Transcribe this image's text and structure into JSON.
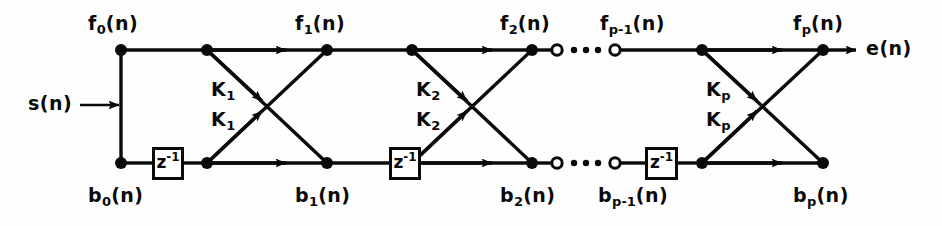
{
  "figure": {
    "line_color": "#0a0a0a",
    "background_color": "#ffffff"
  },
  "input": {
    "label": "s(n)",
    "name": "input-signal"
  },
  "output": {
    "label": "e(n)",
    "name": "output-error-signal"
  },
  "delay_blocks": [
    {
      "base": "z",
      "exponent": "-1"
    },
    {
      "base": "z",
      "exponent": "-1"
    },
    {
      "base": "z",
      "exponent": "-1"
    }
  ],
  "forward_labels": [
    {
      "base": "f",
      "sub": "0",
      "arg": "(n)"
    },
    {
      "base": "f",
      "sub": "1",
      "arg": "(n)"
    },
    {
      "base": "f",
      "sub": "2",
      "arg": "(n)"
    },
    {
      "base": "f",
      "sub": "p-1",
      "arg": "(n)"
    },
    {
      "base": "f",
      "sub": "p",
      "arg": "(n)"
    }
  ],
  "backward_labels": [
    {
      "base": "b",
      "sub": "0",
      "arg": "(n)"
    },
    {
      "base": "b",
      "sub": "1",
      "arg": "(n)"
    },
    {
      "base": "b",
      "sub": "2",
      "arg": "(n)"
    },
    {
      "base": "b",
      "sub": "p-1",
      "arg": "(n)"
    },
    {
      "base": "b",
      "sub": "p",
      "arg": "(n)"
    }
  ],
  "reflection_coefficients": [
    {
      "base": "K",
      "sub": "1",
      "position": "upper"
    },
    {
      "base": "K",
      "sub": "1",
      "position": "lower"
    },
    {
      "base": "K",
      "sub": "2",
      "position": "upper"
    },
    {
      "base": "K",
      "sub": "2",
      "position": "lower"
    },
    {
      "base": "K",
      "sub": "p",
      "position": "upper"
    },
    {
      "base": "K",
      "sub": "p",
      "position": "lower"
    }
  ],
  "ellipsis": {
    "glyph": "•",
    "count": 3,
    "meaning": "stages 3 through p-1 omitted"
  },
  "geometry": {
    "top_rail_y": 50,
    "bottom_rail_y": 163,
    "stage_node_x": [
      121,
      207,
      327,
      412,
      532,
      702,
      823
    ],
    "open_circle_x": [
      557,
      615
    ],
    "output_arrow_x": 858
  }
}
